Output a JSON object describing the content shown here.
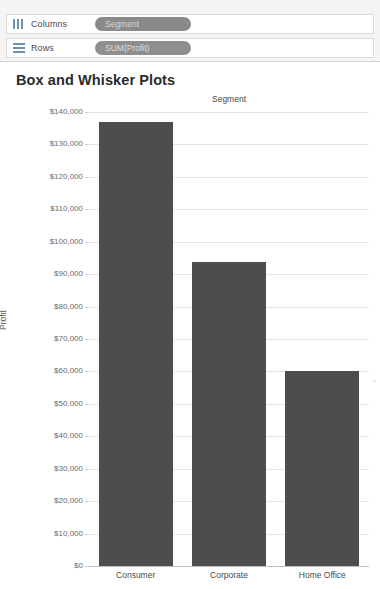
{
  "shelves": [
    {
      "label": "Columns",
      "icon": "columns-icon",
      "pill": "Segment",
      "pill_kind": "dimension"
    },
    {
      "label": "Rows",
      "icon": "rows-icon",
      "pill": "SUM(Profit)",
      "pill_kind": "measure"
    }
  ],
  "viz": {
    "title": "Box and Whisker Plots",
    "column_header": "Segment",
    "edge_mark": "×"
  },
  "chart_data": {
    "type": "bar",
    "title": "Box and Whisker Plots",
    "xlabel": "Segment",
    "ylabel": "Profit",
    "categories": [
      "Consumer",
      "Corporate",
      "Home Office"
    ],
    "values": [
      136800,
      93600,
      60000
    ],
    "value_labels": [
      "$136,800",
      "$93,600",
      "$60,000"
    ],
    "ylim": [
      0,
      140000
    ],
    "ytick_values": [
      0,
      10000,
      20000,
      30000,
      40000,
      50000,
      60000,
      70000,
      80000,
      90000,
      100000,
      110000,
      120000,
      130000,
      140000
    ],
    "ytick_labels": [
      "$0",
      "$10,000",
      "$20,000",
      "$30,000",
      "$40,000",
      "$50,000",
      "$60,000",
      "$70,000",
      "$80,000",
      "$90,000",
      "$100,000",
      "$110,000",
      "$120,000",
      "$130,000",
      "$140,000"
    ],
    "grid": true,
    "legend": "none",
    "bar_color": "#4d4d4d",
    "grid_color": "#e4e4e4"
  }
}
